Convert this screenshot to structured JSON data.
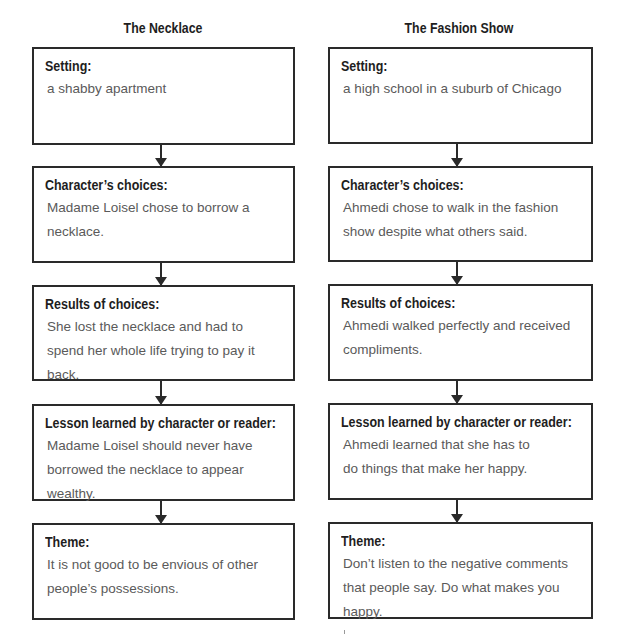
{
  "columns": [
    {
      "title": "The Necklace",
      "boxes": [
        {
          "label": "Setting:",
          "text": "a shabby apartment"
        },
        {
          "label": "Character’s choices:",
          "text": "Madame Loisel chose to borrow a necklace."
        },
        {
          "label": "Results of choices:",
          "text": "She lost the necklace and had to spend her whole life trying to pay it back."
        },
        {
          "label": "Lesson learned by character or reader:",
          "text": "Madame Loisel should never have borrowed the necklace to appear wealthy."
        },
        {
          "label": "Theme:",
          "text": "It is not good to be envious of other people’s possessions."
        }
      ]
    },
    {
      "title": "The Fashion Show",
      "boxes": [
        {
          "label": "Setting:",
          "text": "a high school in a suburb of Chicago"
        },
        {
          "label": "Character’s choices:",
          "text": "Ahmedi chose to walk in the fashion show despite what others said."
        },
        {
          "label": "Results of choices:",
          "text": "Ahmedi walked perfectly and received compliments."
        },
        {
          "label": "Lesson learned by character or reader:",
          "text": "Ahmedi learned that she has to do things that make her happy."
        },
        {
          "label": "Theme:",
          "text": "Don’t listen to the negative comments that people say. Do what makes you happy."
        }
      ]
    }
  ]
}
